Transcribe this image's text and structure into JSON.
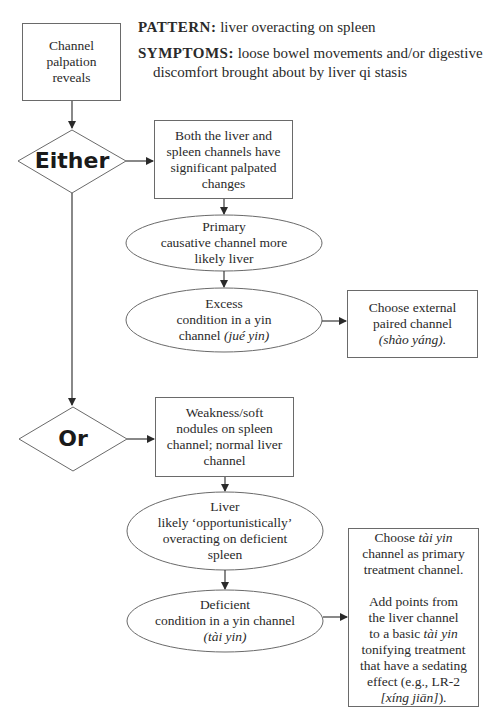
{
  "header": {
    "pattern_label": "PATTERN:",
    "pattern_text": "liver overacting on spleen",
    "symptoms_label": "SYMPTOMS:",
    "symptoms_line1": "loose bowel movements and/or digestive",
    "symptoms_line2": "discomfort brought about by liver qi stasis"
  },
  "start": {
    "lines": [
      "Channel",
      "palpation",
      "reveals"
    ]
  },
  "either": {
    "label": "Either",
    "condition": [
      "Both the liver and",
      "spleen channels have",
      "significant palpated",
      "changes"
    ],
    "primary": [
      "Primary",
      "causative channel more",
      "likely liver"
    ],
    "excess_lines": [
      "Excess",
      "condition in a yin"
    ],
    "excess_prefix": "channel ",
    "excess_italic": "(jué yin)",
    "result_lines": [
      "Choose external",
      "paired channel"
    ],
    "result_italic": "(shào yáng)."
  },
  "or": {
    "label": "Or",
    "condition": [
      "Weakness/soft",
      "nodules on spleen",
      "channel; normal liver",
      "channel"
    ],
    "liver": [
      "Liver",
      "likely ‘opportunistically’",
      "overacting on deficient",
      "spleen"
    ],
    "deficient_lines": [
      "Deficient",
      "condition in a yin channel"
    ],
    "deficient_italic": "(tài yin)",
    "result": {
      "p1_prefix": "Choose ",
      "p1_italic": "tài yin",
      "p1_line2": "channel as primary",
      "p1_line3": "treatment channel.",
      "p2_line1": "Add points from",
      "p2_line2": "the liver channel",
      "p2_line3_prefix": "to a basic ",
      "p2_line3_italic": "tài yin",
      "p2_line4": "tonifying treatment",
      "p2_line5": "that have a sedating",
      "p2_line6": "effect (e.g., LR-2",
      "p2_line7_italic": "[xíng jiān]",
      "p2_line7_suffix": ")."
    }
  },
  "colors": {
    "line": "#3a3a3a",
    "border": "#6a6a6a",
    "text": "#2a2a2a"
  }
}
